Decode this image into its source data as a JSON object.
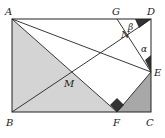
{
  "diagram": {
    "type": "geometry",
    "shape": "rectangle ABCD with folding",
    "points": {
      "A": {
        "label": "A",
        "x": 12,
        "y": 19
      },
      "D": {
        "label": "D",
        "x": 151,
        "y": 19
      },
      "B": {
        "label": "B",
        "x": 12,
        "y": 112
      },
      "C": {
        "label": "C",
        "x": 151,
        "y": 112
      },
      "G": {
        "label": "G",
        "x": 117,
        "y": 19
      },
      "E": {
        "label": "E",
        "x": 151,
        "y": 72
      },
      "F": {
        "label": "F",
        "x": 117,
        "y": 112
      },
      "M": {
        "label": "M",
        "x": 72,
        "y": 73
      },
      "N": {
        "label": "N",
        "x": 131,
        "y": 33
      }
    },
    "angles": {
      "alpha": {
        "label": "α"
      },
      "beta": {
        "label": "β"
      }
    },
    "segments": [
      "AB",
      "BC",
      "CD",
      "DA",
      "AF",
      "AE",
      "BD",
      "GE",
      "FE"
    ],
    "shaded_regions": [
      "triangle ABF (light)",
      "triangle FCE (medium)"
    ],
    "right_angle_marks": [
      "F (angle AFE)"
    ],
    "colors": {
      "line": "#222222",
      "light_shade": "#d4d4d4",
      "medium_shade": "#a8a8a8",
      "dark_mark": "#333333"
    }
  }
}
